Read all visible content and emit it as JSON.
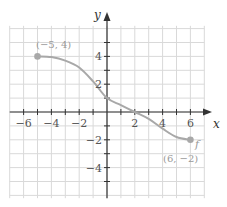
{
  "chart_data": {
    "type": "line",
    "title": "",
    "xlabel": "x",
    "ylabel": "y",
    "function_label": "f",
    "xlim": [
      -7,
      7
    ],
    "ylim": [
      -6,
      6
    ],
    "grid": true,
    "x_ticks": [
      -6,
      -4,
      -2,
      2,
      4,
      6
    ],
    "y_ticks": [
      4,
      2,
      -2,
      -4
    ],
    "x_tick_labels": [
      "−6",
      "−4",
      "−2",
      "2",
      "4",
      "6"
    ],
    "y_tick_labels": [
      "4",
      "2",
      "−2",
      "−4"
    ],
    "series": [
      {
        "name": "f",
        "x": [
          -5,
          -4,
          -3,
          -2,
          -1,
          0,
          1,
          2,
          3,
          4,
          5,
          6
        ],
        "y": [
          4,
          3.95,
          3.7,
          3.2,
          2.2,
          1,
          0.5,
          0,
          -0.5,
          -1.2,
          -1.8,
          -2
        ]
      }
    ],
    "annotations": [
      {
        "text": "(−5, 4)",
        "x": -5,
        "y": 4
      },
      {
        "text": "(6, −2)",
        "x": 6,
        "y": -2
      }
    ],
    "colors": {
      "curve": "#a8a8a8",
      "grid": "#d9d9d9",
      "axis": "#333333",
      "endpoint": "#a8a8a8"
    }
  }
}
